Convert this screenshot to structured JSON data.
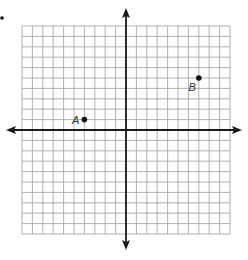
{
  "figure": {
    "type": "coordinate-plane",
    "grid": {
      "x_min": -10,
      "x_max": 10,
      "y_min": -10,
      "y_max": 10,
      "cell_px": 10.4,
      "origin_px": [
        126,
        130
      ],
      "line_color": "#a8a8a8"
    },
    "axes": {
      "color": "#1a1a1a",
      "x_axis_arrows": true,
      "y_axis_arrows": true,
      "tick_labels": false
    },
    "points": [
      {
        "label": "A",
        "x": -4,
        "y": 1,
        "label_side": "left"
      },
      {
        "label": "B",
        "x": 7,
        "y": 5,
        "label_side": "below-left"
      }
    ]
  },
  "chart_data": {
    "type": "scatter",
    "title": "",
    "xlabel": "",
    "ylabel": "",
    "xlim": [
      -10,
      10
    ],
    "ylim": [
      -10,
      10
    ],
    "grid": true,
    "series": [
      {
        "name": "points",
        "x": [
          -4,
          7
        ],
        "y": [
          1,
          5
        ],
        "labels": [
          "A",
          "B"
        ]
      }
    ]
  }
}
